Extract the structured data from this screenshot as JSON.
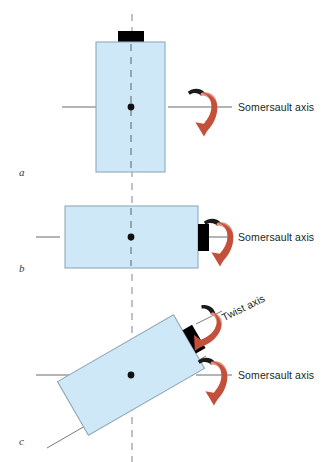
{
  "figure": {
    "background_color": "#ffffff",
    "body_fill": "#cfe8f7",
    "body_stroke": "#8fa9b8",
    "head_fill": "#000000",
    "arrow_color": "#c8503c",
    "arrow_highlight": "#e08878",
    "axis_line_color": "#6b6b6b",
    "solid_axis_color": "#1a1a2e",
    "dashed_axis_color": "#9aa3ad"
  },
  "panels": [
    {
      "id": "a",
      "label": "a",
      "label_x": 19,
      "label_y": 166,
      "body": {
        "x": 96,
        "y": 42,
        "w": 69,
        "h": 130,
        "rotate": 0
      },
      "head": {
        "x": 118,
        "y": 31,
        "w": 26,
        "h": 11,
        "rotate": 0
      },
      "center": {
        "x": 131,
        "y": 107
      },
      "labels": [
        {
          "name": "somersault-axis-label",
          "text": "Somersault axis",
          "x": 238,
          "y": 101,
          "rotate": 0
        }
      ]
    },
    {
      "id": "b",
      "label": "b",
      "label_x": 19,
      "label_y": 262,
      "body": {
        "x": 65,
        "y": 206,
        "w": 133,
        "h": 62,
        "rotate": 0
      },
      "head": {
        "x": 198,
        "y": 225,
        "w": 11,
        "h": 26,
        "rotate": 0
      },
      "center": {
        "x": 131,
        "y": 237
      },
      "labels": [
        {
          "name": "somersault-axis-label",
          "text": "Somersault axis",
          "x": 238,
          "y": 231,
          "rotate": 0
        }
      ]
    },
    {
      "id": "c",
      "label": "c",
      "label_x": 19,
      "label_y": 435,
      "body": {
        "x": 72,
        "y": 344,
        "w": 133,
        "h": 62,
        "rotate": -30
      },
      "head": {
        "x": 168,
        "y": 316,
        "w": 12,
        "h": 26,
        "rotate": -30
      },
      "center": {
        "x": 131,
        "y": 375
      },
      "labels": [
        {
          "name": "twist-axis-label",
          "text": "Twist axis",
          "x": 225,
          "y": 311,
          "rotate": -26
        },
        {
          "name": "somersault-axis-label",
          "text": "Somersault axis",
          "x": 238,
          "y": 369,
          "rotate": 0
        }
      ]
    }
  ],
  "axes": {
    "vertical_dashed": {
      "x": 132,
      "y1": 14,
      "y2": 462,
      "style": "dashed"
    },
    "somersault_horizontal": [
      {
        "panel": "a",
        "y": 107,
        "x1": 62,
        "x2": 232
      },
      {
        "panel": "b",
        "y": 237,
        "x1": 36,
        "x2": 232
      },
      {
        "panel": "c",
        "y": 375,
        "x1": 36,
        "x2": 232
      }
    ]
  },
  "arrows": [
    {
      "name": "somersault-rotation-arrow-a",
      "panel": "a",
      "cx": 203,
      "cy": 108,
      "rotate": 0
    },
    {
      "name": "somersault-rotation-arrow-b",
      "panel": "b",
      "cx": 218,
      "cy": 238,
      "rotate": 0
    },
    {
      "name": "twist-rotation-arrow-c",
      "panel": "c",
      "cx": 205,
      "cy": 325,
      "rotate": -30
    },
    {
      "name": "somersault-rotation-arrow-c",
      "panel": "c",
      "cx": 213,
      "cy": 376,
      "rotate": 0
    }
  ],
  "corner_mark": {
    "text": "",
    "x": 300,
    "y": 3
  }
}
